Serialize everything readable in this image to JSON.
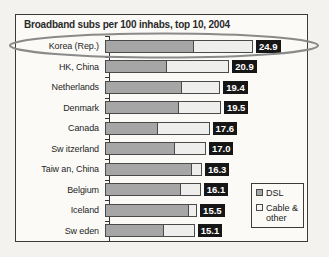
{
  "chart_data": {
    "type": "bar",
    "title": "Broadband subs per 100 inhabs, top 10, 2004",
    "xlabel": "",
    "ylabel": "",
    "orientation": "horizontal",
    "stacked": true,
    "grid": false,
    "legend_position": "bottom-right",
    "xlim": [
      0,
      24.9
    ],
    "categories": [
      "Korea (Rep.)",
      "HK, China",
      "Netherlands",
      "Denmark",
      "Canada",
      "Sw itzerland",
      "Taiw an, China",
      "Belgium",
      "Iceland",
      "Sw eden"
    ],
    "values": [
      24.9,
      20.9,
      19.4,
      19.5,
      17.6,
      17.0,
      16.3,
      16.1,
      15.5,
      15.1
    ],
    "value_labels": [
      "24.9",
      "20.9",
      "19.4",
      "19.5",
      "17.6",
      "17.0",
      "16.3",
      "16.1",
      "15.5",
      "15.1"
    ],
    "series": [
      {
        "name": "DSL",
        "values": [
          14.8,
          10.2,
          12.8,
          12.3,
          8.7,
          11.6,
          14.5,
          12.6,
          13.9,
          9.8
        ]
      },
      {
        "name": "Cable & other",
        "values": [
          10.1,
          10.7,
          6.6,
          7.2,
          8.9,
          5.4,
          1.8,
          3.5,
          1.6,
          5.3
        ]
      }
    ]
  },
  "legend": {
    "items": [
      {
        "label": "DSL",
        "color": "#a6a6a6"
      },
      {
        "label": "Cable & other",
        "color": "#f4f4f2"
      }
    ]
  },
  "annotation": {
    "highlighted_row": "Korea (Rep.)",
    "shape": "ellipse",
    "color": "#8a8a8a"
  }
}
